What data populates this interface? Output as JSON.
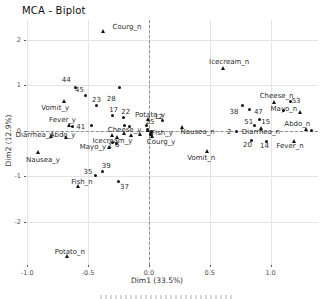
{
  "chart_data": {
    "type": "scatter",
    "title": "MCA - Biplot",
    "xlabel": "Dim1 (33.5%)",
    "ylabel": "Dim2 (12.9%)",
    "xlim": [
      -1.01,
      1.39
    ],
    "ylim": [
      -2.95,
      2.44
    ],
    "x_ticks": [
      {
        "label": "-1.0",
        "value": -1.0
      },
      {
        "label": "-0.5",
        "value": -0.5
      },
      {
        "label": "0.0",
        "value": 0.0
      },
      {
        "label": "0.5",
        "value": 0.5
      },
      {
        "label": "1.0",
        "value": 1.0
      }
    ],
    "y_ticks": [
      {
        "label": "2",
        "value": 2
      },
      {
        "label": "1",
        "value": 1
      },
      {
        "label": "0",
        "value": 0
      },
      {
        "label": "-1",
        "value": -1
      },
      {
        "label": "-2",
        "value": -2
      }
    ],
    "grid": true,
    "legend": "none",
    "reference_lines": {
      "x": 0,
      "y": 0,
      "style": "dashed"
    },
    "colors": {
      "marker": "#111111",
      "label": "#2b2b2b",
      "grid": "#e4e4e4",
      "reference": "#8f8f8f",
      "tick_text": "#4d4d4d"
    },
    "series": [
      {
        "name": "individuals",
        "marker": "dot",
        "points": [
          {
            "label": "44",
            "x": -0.6,
            "y": 0.95,
            "lx": -0.68,
            "ly": 1.12
          },
          {
            "label": "45",
            "x": -0.52,
            "y": 0.79,
            "lx": -0.57,
            "ly": 0.9
          },
          {
            "label": "23",
            "x": -0.43,
            "y": 0.57,
            "lx": -0.43,
            "ly": 0.68
          },
          {
            "label": "28",
            "x": -0.24,
            "y": 0.95,
            "lx": -0.31,
            "ly": 0.7
          },
          {
            "label": "17",
            "x": -0.3,
            "y": 0.33,
            "lx": -0.29,
            "ly": 0.46
          },
          {
            "label": "22",
            "x": -0.21,
            "y": 0.29,
            "lx": -0.19,
            "ly": 0.42
          },
          {
            "label": "41",
            "x": -0.63,
            "y": 0.09,
            "lx": -0.56,
            "ly": 0.09
          },
          {
            "label": "25",
            "x": -0.02,
            "y": 0.13,
            "lx": 0.01,
            "ly": 0.2
          },
          {
            "label": "12",
            "x": 0.11,
            "y": 0.24,
            "lx": 0.08,
            "ly": 0.31
          },
          {
            "label": "1",
            "x": -0.3,
            "y": -0.26,
            "lx": -0.32,
            "ly": -0.33
          },
          {
            "label": "6",
            "x": -0.27,
            "y": -0.28,
            "lx": -0.26,
            "ly": -0.31
          },
          {
            "label": "39",
            "x": -0.38,
            "y": -0.9,
            "lx": -0.35,
            "ly": -0.77
          },
          {
            "label": "35",
            "x": -0.44,
            "y": -0.99,
            "lx": -0.5,
            "ly": -0.9
          },
          {
            "label": "37",
            "x": -0.25,
            "y": -1.12,
            "lx": -0.2,
            "ly": -1.23
          },
          {
            "label": "38",
            "x": 0.77,
            "y": 0.55,
            "lx": 0.7,
            "ly": 0.42
          },
          {
            "label": "47",
            "x": 0.83,
            "y": 0.48,
            "lx": 0.9,
            "ly": 0.42
          },
          {
            "label": "53",
            "x": 1.16,
            "y": 0.64,
            "lx": 1.21,
            "ly": 0.66
          },
          {
            "label": "51",
            "x": 0.87,
            "y": 0.13,
            "lx": 0.82,
            "ly": 0.2
          },
          {
            "label": "15",
            "x": 0.91,
            "y": 0.26,
            "lx": 0.96,
            "ly": 0.2
          },
          {
            "label": "2",
            "x": 0.72,
            "y": -0.02,
            "lx": 0.66,
            "ly": -0.02
          },
          {
            "label": "20",
            "x": 0.84,
            "y": -0.22,
            "lx": 0.81,
            "ly": -0.31
          },
          {
            "label": "14",
            "x": 0.97,
            "y": -0.24,
            "lx": 0.95,
            "ly": -0.33
          }
        ]
      },
      {
        "name": "categories",
        "marker": "triangle",
        "points": [
          {
            "label": "Courg_n",
            "x": -0.37,
            "y": 2.18,
            "lx": -0.18,
            "ly": 2.29
          },
          {
            "label": "Icecream_n",
            "x": 0.61,
            "y": 1.36,
            "lx": 0.66,
            "ly": 1.52
          },
          {
            "label": "Cheese_n",
            "x": 1.03,
            "y": 0.62,
            "lx": 1.05,
            "ly": 0.77
          },
          {
            "label": "Mayo_n",
            "x": 1.25,
            "y": 0.4,
            "lx": 1.11,
            "ly": 0.48
          },
          {
            "label": "Abdo_n",
            "x": 1.3,
            "y": 0.02,
            "lx": 1.22,
            "ly": 0.15
          },
          {
            "label": "Nausea_n",
            "x": 0.28,
            "y": 0.07,
            "lx": 0.4,
            "ly": -0.02
          },
          {
            "label": "Diarrhea_n",
            "x": 0.93,
            "y": 0.04,
            "lx": 0.92,
            "ly": -0.02
          },
          {
            "label": "Fever_n",
            "x": 1.2,
            "y": -0.24,
            "lx": 1.16,
            "ly": -0.33
          },
          {
            "label": "Vomit_n",
            "x": 0.48,
            "y": -0.46,
            "lx": 0.43,
            "ly": -0.59
          },
          {
            "label": "Courg_y",
            "x": 0.03,
            "y": -0.13,
            "lx": 0.1,
            "ly": -0.24
          },
          {
            "label": "Fish_y",
            "x": 0.02,
            "y": -0.04,
            "lx": 0.11,
            "ly": -0.04
          },
          {
            "label": "Potato_y",
            "x": 0.0,
            "y": 0.24,
            "lx": 0.01,
            "ly": 0.35
          },
          {
            "label": "Cheese_y",
            "x": -0.2,
            "y": -0.07,
            "lx": -0.2,
            "ly": 0.02
          },
          {
            "label": "Icecream_y",
            "x": -0.26,
            "y": -0.15,
            "lx": -0.3,
            "ly": -0.22
          },
          {
            "label": "Mayo_y",
            "x": -0.32,
            "y": -0.37,
            "lx": -0.46,
            "ly": -0.35
          },
          {
            "label": "Abdo_y",
            "x": -0.68,
            "y": -0.15,
            "lx": -0.71,
            "ly": -0.09
          },
          {
            "label": "Diarrhea_y",
            "x": -0.8,
            "y": -0.13,
            "lx": -0.94,
            "ly": -0.09
          },
          {
            "label": "Fever_y",
            "x": -0.65,
            "y": 0.11,
            "lx": -0.71,
            "ly": 0.24
          },
          {
            "label": "Vomit_y",
            "x": -0.69,
            "y": 0.64,
            "lx": -0.77,
            "ly": 0.51
          },
          {
            "label": "Nausea_y",
            "x": -0.91,
            "y": -0.48,
            "lx": -0.87,
            "ly": -0.64
          },
          {
            "label": "Fish_n",
            "x": -0.58,
            "y": -1.23,
            "lx": -0.55,
            "ly": -1.12
          },
          {
            "label": "Potato_n",
            "x": -0.67,
            "y": -2.77,
            "lx": -0.65,
            "ly": -2.66
          }
        ]
      },
      {
        "name": "overplotted-dots",
        "marker": "dot",
        "points": [
          {
            "x": 1.11,
            "y": 0.46
          },
          {
            "x": 1.34,
            "y": 0.0
          },
          {
            "x": -0.47,
            "y": 0.13
          },
          {
            "x": -0.2,
            "y": 0.13
          },
          {
            "x": -0.16,
            "y": 0.09
          },
          {
            "x": -0.01,
            "y": 0.04
          },
          {
            "x": 0.02,
            "y": -0.01
          },
          {
            "x": 0.01,
            "y": -0.08
          }
        ]
      },
      {
        "name": "overplotted-triangles",
        "marker": "triangle",
        "points": [
          {
            "x": -0.3,
            "y": -0.11
          },
          {
            "x": -0.14,
            "y": -0.11
          },
          {
            "x": -0.07,
            "y": -0.09
          },
          {
            "x": 0.0,
            "y": 0.0
          },
          {
            "x": 0.02,
            "y": -0.09
          }
        ]
      }
    ]
  }
}
